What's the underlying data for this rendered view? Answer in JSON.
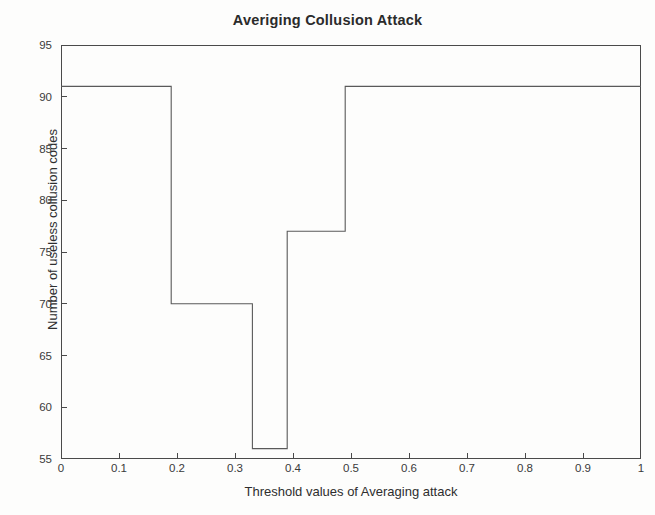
{
  "figure": {
    "background_color": "#fdfdfc",
    "axis_color": "#4a4a4a",
    "line_color": "#5a5a5a"
  },
  "chart_data": {
    "type": "line",
    "style": "step",
    "title": "Averiging Collusion Attack",
    "xlabel": "Threshold values of Averaging attack",
    "ylabel": "Number of useless collusion codes",
    "xlim": [
      0,
      1
    ],
    "ylim": [
      55,
      95
    ],
    "grid": false,
    "legend": null,
    "xticks": [
      0,
      0.1,
      0.2,
      0.3,
      0.4,
      0.5,
      0.6,
      0.7,
      0.8,
      0.9,
      1
    ],
    "xtick_labels": [
      "0",
      "0.1",
      "0.2",
      "0.3",
      "0.4",
      "0.5",
      "0.6",
      "0.7",
      "0.8",
      "0.9",
      "1"
    ],
    "yticks": [
      55,
      60,
      65,
      70,
      75,
      80,
      85,
      90,
      95
    ],
    "ytick_labels": [
      "55",
      "60",
      "65",
      "70",
      "75",
      "80",
      "85",
      "90",
      "95"
    ],
    "series": [
      {
        "name": "Useless collusion codes",
        "x": [
          0.0,
          0.19,
          0.19,
          0.33,
          0.33,
          0.39,
          0.39,
          0.49,
          0.49,
          1.0
        ],
        "y": [
          91,
          91,
          70,
          70,
          56,
          56,
          77,
          77,
          91,
          91
        ]
      }
    ],
    "plateaus": [
      {
        "x_start": 0.0,
        "x_end": 0.19,
        "value": 91
      },
      {
        "x_start": 0.19,
        "x_end": 0.33,
        "value": 70
      },
      {
        "x_start": 0.33,
        "x_end": 0.39,
        "value": 56
      },
      {
        "x_start": 0.39,
        "x_end": 0.49,
        "value": 77
      },
      {
        "x_start": 0.49,
        "x_end": 1.0,
        "value": 91
      }
    ]
  }
}
